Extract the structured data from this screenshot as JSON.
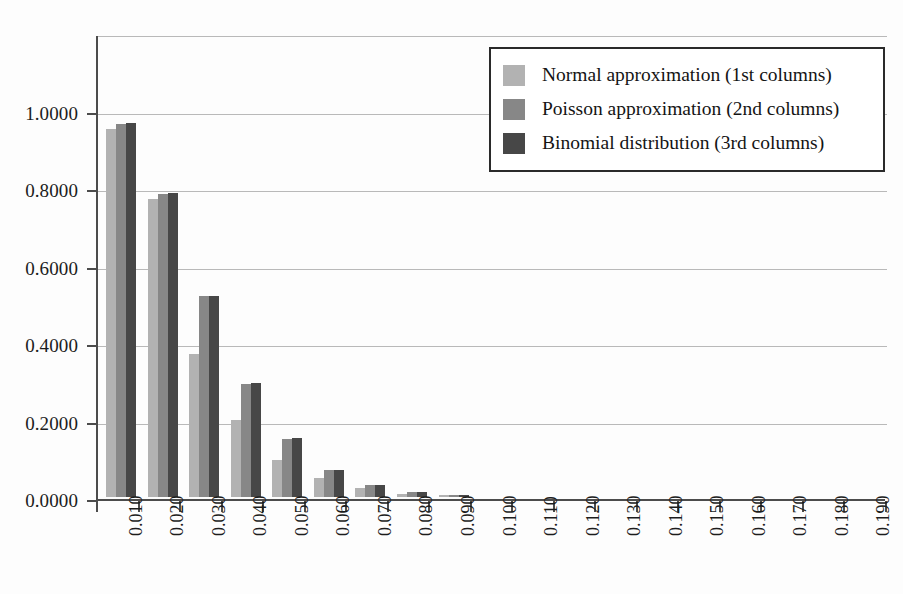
{
  "chart_data": {
    "type": "bar",
    "title": "",
    "xlabel": "",
    "ylabel": "",
    "ylim": [
      0.0,
      1.2
    ],
    "ytick_labels": [
      "0.0000",
      "0.2000",
      "0.4000",
      "0.6000",
      "0.8000",
      "1.0000"
    ],
    "ytick_values": [
      0.0,
      0.2,
      0.4,
      0.6,
      0.8,
      1.0
    ],
    "grid": true,
    "legend_position": "top-right",
    "categories": [
      "0.010",
      "0.020",
      "0.030",
      "0.040",
      "0.050",
      "0.060",
      "0.070",
      "0.080",
      "0.090",
      "0.100",
      "0.110",
      "0.120",
      "0.130",
      "0.140",
      "0.150",
      "0.160",
      "0.170",
      "0.180",
      "0.190"
    ],
    "series": [
      {
        "name": "Normal approximation (1st columns)",
        "color": "#b2b2b2",
        "values": [
          0.95,
          0.77,
          0.37,
          0.2,
          0.096,
          0.049,
          0.023,
          0.009,
          0.004,
          0.0,
          0.0,
          0.0,
          0.0,
          0.0,
          0.0,
          0.0,
          0.0,
          0.0,
          0.0
        ]
      },
      {
        "name": "Poisson approximation (2nd columns)",
        "color": "#878787",
        "values": [
          0.963,
          0.783,
          0.518,
          0.291,
          0.15,
          0.07,
          0.031,
          0.012,
          0.0045,
          0.0,
          0.0,
          0.0,
          0.0,
          0.0,
          0.0,
          0.0,
          0.0,
          0.0,
          0.0
        ]
      },
      {
        "name": "Binomial distribution (3rd columns)",
        "color": "#474747",
        "values": [
          0.965,
          0.784,
          0.52,
          0.293,
          0.152,
          0.071,
          0.032,
          0.0125,
          0.0047,
          0.0,
          0.0,
          0.0,
          0.0,
          0.0,
          0.0,
          0.0,
          0.0,
          0.0,
          0.0
        ]
      }
    ]
  },
  "legend": {
    "items": [
      {
        "label": "Normal approximation (1st columns)",
        "swatch": "s0"
      },
      {
        "label": "Poisson approximation (2nd columns)",
        "swatch": "s1"
      },
      {
        "label": "Binomial distribution (3rd columns)",
        "swatch": "s2"
      }
    ]
  }
}
